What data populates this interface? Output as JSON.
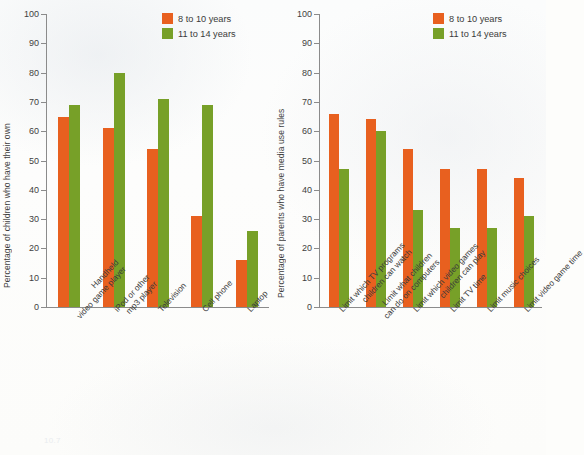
{
  "legend": {
    "series": [
      {
        "label": "8 to 10 years",
        "color": "#e8601f"
      },
      {
        "label": "11 to 14 years",
        "color": "#77a028"
      }
    ]
  },
  "footnote": "10.7",
  "chart_data": [
    {
      "type": "bar",
      "title": "",
      "panel": "left",
      "ylabel": "Percentage of children who have their own",
      "xlabel": "",
      "ylim": [
        0,
        100
      ],
      "yticks": [
        0,
        10,
        20,
        30,
        40,
        50,
        60,
        70,
        80,
        90,
        100
      ],
      "grid": false,
      "legend_position": "top-right",
      "categories": [
        "Handheld video game player",
        "iPod or other mp3 player",
        "Television",
        "Cell phone",
        "Laptop"
      ],
      "category_lines": [
        [
          "Handheld",
          "video game player"
        ],
        [
          "iPod or other",
          "mp3 player"
        ],
        [
          "Television",
          ""
        ],
        [
          "Cell phone",
          ""
        ],
        [
          "Laptop",
          ""
        ]
      ],
      "series": [
        {
          "name": "8 to 10 years",
          "color": "#e8601f",
          "values": [
            65,
            61,
            54,
            31,
            16
          ]
        },
        {
          "name": "11 to 14 years",
          "color": "#77a028",
          "values": [
            69,
            80,
            71,
            69,
            26
          ]
        }
      ]
    },
    {
      "type": "bar",
      "title": "",
      "panel": "right",
      "ylabel": "Percentage of parents who have media use rules",
      "xlabel": "",
      "ylim": [
        0,
        100
      ],
      "yticks": [
        0,
        10,
        20,
        30,
        40,
        50,
        60,
        70,
        80,
        90,
        100
      ],
      "grid": false,
      "legend_position": "top-right",
      "categories": [
        "Limit which TV programs children can watch",
        "Limit what children can do on computers",
        "Limit which video games children can play",
        "Limit TV time",
        "Limit music choices",
        "Limit video game time"
      ],
      "category_lines": [
        [
          "Limit which TV programs",
          "children can watch"
        ],
        [
          "Limit what children",
          "can do on computers"
        ],
        [
          "Limit which video games",
          "children can play"
        ],
        [
          "Limit TV time",
          ""
        ],
        [
          "Limit music choices",
          ""
        ],
        [
          "Limit video game time",
          ""
        ]
      ],
      "series": [
        {
          "name": "8 to 10 years",
          "color": "#e8601f",
          "values": [
            66,
            64,
            54,
            47,
            47,
            44
          ]
        },
        {
          "name": "11 to 14 years",
          "color": "#77a028",
          "values": [
            47,
            60,
            33,
            27,
            27,
            31
          ]
        }
      ]
    }
  ]
}
